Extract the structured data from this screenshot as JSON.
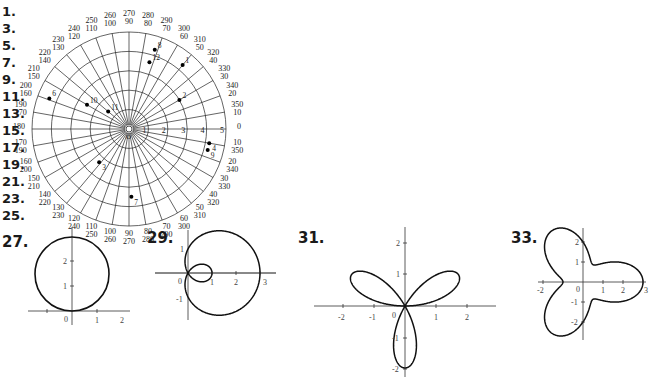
{
  "answer_numbers": [
    "1.",
    "3.",
    "5.",
    "7.",
    "9.",
    "11.",
    "13.",
    "15.",
    "17.",
    "19.",
    "21.",
    "23.",
    "25."
  ],
  "polar_grid": {
    "radius_ticks": [
      "1",
      "2",
      "3",
      "4",
      "5"
    ],
    "center_label": "O",
    "angle_labels": [
      {
        "deg": 0,
        "a": "0",
        "b": ""
      },
      {
        "deg": 10,
        "a": "350",
        "b": "10"
      },
      {
        "deg": 20,
        "a": "340",
        "b": "20"
      },
      {
        "deg": 30,
        "a": "330",
        "b": "30"
      },
      {
        "deg": 40,
        "a": "320",
        "b": "40"
      },
      {
        "deg": 50,
        "a": "310",
        "b": "50"
      },
      {
        "deg": 60,
        "a": "300",
        "b": "60"
      },
      {
        "deg": 70,
        "a": "290",
        "b": "70"
      },
      {
        "deg": 80,
        "a": "280",
        "b": "80"
      },
      {
        "deg": 90,
        "a": "270",
        "b": "90"
      },
      {
        "deg": 100,
        "a": "260",
        "b": "100"
      },
      {
        "deg": 110,
        "a": "250",
        "b": "110"
      },
      {
        "deg": 120,
        "a": "240",
        "b": "120"
      },
      {
        "deg": 130,
        "a": "230",
        "b": "130"
      },
      {
        "deg": 140,
        "a": "220",
        "b": "140"
      },
      {
        "deg": 150,
        "a": "210",
        "b": "150"
      },
      {
        "deg": 160,
        "a": "200",
        "b": "160"
      },
      {
        "deg": 170,
        "a": "190",
        "b": "170"
      },
      {
        "deg": 180,
        "a": "180",
        "b": ""
      },
      {
        "deg": 190,
        "a": "170",
        "b": "190"
      },
      {
        "deg": 200,
        "a": "160",
        "b": "200"
      },
      {
        "deg": 210,
        "a": "150",
        "b": "210"
      },
      {
        "deg": 220,
        "a": "140",
        "b": "220"
      },
      {
        "deg": 230,
        "a": "130",
        "b": "230"
      },
      {
        "deg": 240,
        "a": "120",
        "b": "240"
      },
      {
        "deg": 250,
        "a": "110",
        "b": "250"
      },
      {
        "deg": 260,
        "a": "100",
        "b": "260"
      },
      {
        "deg": 270,
        "a": "90",
        "b": "270"
      },
      {
        "deg": 280,
        "a": "80",
        "b": "280"
      },
      {
        "deg": 290,
        "a": "70",
        "b": "290"
      },
      {
        "deg": 300,
        "a": "60",
        "b": "300"
      },
      {
        "deg": 310,
        "a": "50",
        "b": "310"
      },
      {
        "deg": 320,
        "a": "40",
        "b": "320"
      },
      {
        "deg": 330,
        "a": "30",
        "b": "330"
      },
      {
        "deg": 340,
        "a": "20",
        "b": "340"
      },
      {
        "deg": 350,
        "a": "10",
        "b": "350"
      }
    ],
    "points": [
      {
        "label": "1",
        "deg": 50,
        "r": 4.3
      },
      {
        "label": "2",
        "deg": 30,
        "r": 3.0
      },
      {
        "label": "3",
        "deg": 228,
        "r": 2.3
      },
      {
        "label": "4",
        "deg": 350,
        "r": 4.2
      },
      {
        "label": "6",
        "deg": 159,
        "r": 4.4
      },
      {
        "label": "7",
        "deg": 272,
        "r": 3.5
      },
      {
        "label": "8",
        "deg": 72,
        "r": 4.3
      },
      {
        "label": "9",
        "deg": 345,
        "r": 4.2
      },
      {
        "label": "10",
        "deg": 150,
        "r": 2.5
      },
      {
        "label": "11",
        "deg": 140,
        "r": 1.4
      },
      {
        "label": "12",
        "deg": 73,
        "r": 3.6
      },
      {
        "label": "12b",
        "deg": 118,
        "r": 3.0
      }
    ]
  },
  "figures": [
    {
      "label": "27.",
      "ticks_x": [
        "0",
        "1",
        "2"
      ],
      "ticks_y": [
        "1",
        "2"
      ]
    },
    {
      "label": "29.",
      "ticks_x": [
        "0",
        "1",
        "2",
        "3"
      ],
      "ticks_y": [
        "1",
        "-1"
      ]
    },
    {
      "label": "31.",
      "ticks_x": [
        "-2",
        "-1",
        "0",
        "1",
        "2"
      ],
      "ticks_y": [
        "2",
        "1",
        "-1",
        "-2"
      ]
    },
    {
      "label": "33.",
      "ticks_x": [
        "-2",
        "0",
        "1",
        "2",
        "3"
      ],
      "ticks_y": [
        "2",
        "1",
        "-1",
        "-2"
      ]
    }
  ]
}
